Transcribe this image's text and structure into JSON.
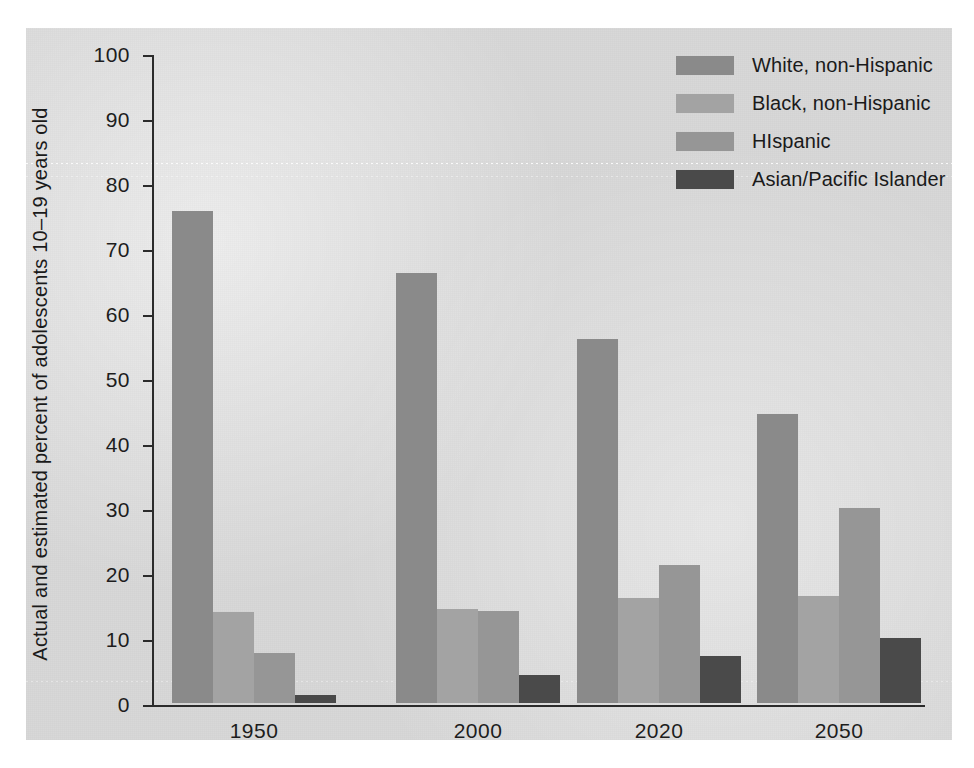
{
  "figure": {
    "top_fragment": "",
    "background_color": "#d8d8d8",
    "axis_color": "#2b2b2b"
  },
  "chart_data": {
    "type": "bar",
    "title": "",
    "xlabel": "",
    "ylabel": "Actual and estimated percent of adolescents 10–19 years old",
    "categories": [
      "1950",
      "2000",
      "2020",
      "2050"
    ],
    "ylim": [
      0,
      100
    ],
    "yticks": [
      "0",
      "10",
      "20",
      "30",
      "40",
      "50",
      "60",
      "70",
      "80",
      "90",
      "100"
    ],
    "grid": false,
    "legend_position": "top-right",
    "series": [
      {
        "name": "White, non-Hispanic",
        "color": "#8a8a8a",
        "values": [
          75.7,
          66.1,
          56.0,
          44.5
        ]
      },
      {
        "name": "Black, non-Hispanic",
        "color": "#a3a3a3",
        "values": [
          14.0,
          14.5,
          16.1,
          16.5
        ]
      },
      {
        "name": "HIspanic",
        "color": "#969696",
        "values": [
          7.7,
          14.1,
          21.2,
          30.0
        ]
      },
      {
        "name": "Asian/Pacific Islander",
        "color": "#4a4a4a",
        "values": [
          1.3,
          4.3,
          7.3,
          10.0
        ]
      }
    ]
  },
  "legend": {
    "items": [
      {
        "label": "White, non-Hispanic",
        "color": "#8a8a8a"
      },
      {
        "label": "Black, non-Hispanic",
        "color": "#a3a3a3"
      },
      {
        "label": "HIspanic",
        "color": "#969696"
      },
      {
        "label": "Asian/Pacific Islander",
        "color": "#4a4a4a"
      }
    ]
  }
}
